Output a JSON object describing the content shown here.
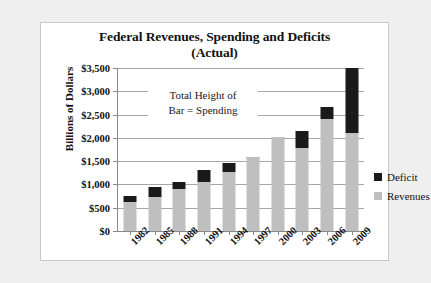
{
  "chart_data": {
    "type": "bar",
    "title": "Federal Revenues, Spending  and Deficits (Actual)",
    "title_line1": "Federal Revenues, Spending  and Deficits",
    "title_line2": "(Actual)",
    "xlabel": "",
    "ylabel": "Billions of Dollars",
    "ylim": [
      0,
      3500
    ],
    "ytick_labels": [
      "$3,500",
      "$3,000",
      "$2,500",
      "$2,000",
      "$1,500",
      "$1,000",
      "$500",
      "$0"
    ],
    "ytick_values": [
      3500,
      3000,
      2500,
      2000,
      1500,
      1000,
      500,
      0
    ],
    "grid": true,
    "stacked": true,
    "legend_position": "right",
    "annotation": "Total Height of Bar = Spending",
    "annotation_line1": "Total Height of",
    "annotation_line2": "Bar = Spending",
    "categories": [
      "1982",
      "1985",
      "1988",
      "1991",
      "1994",
      "1997",
      "2000",
      "2003",
      "2006",
      "2009"
    ],
    "series": [
      {
        "name": "Revenues",
        "color": "#bfbfbf",
        "values": [
          620,
          740,
          910,
          1050,
          1260,
          1580,
          2025,
          1780,
          2410,
          2100
        ]
      },
      {
        "name": "Deficit",
        "color": "#1a1a1a",
        "values": [
          130,
          210,
          150,
          270,
          200,
          20,
          0,
          375,
          250,
          1400
        ]
      }
    ],
    "spending_totals": [
      750,
      950,
      1060,
      1320,
      1460,
      1600,
      2025,
      2155,
      2660,
      3500
    ]
  },
  "legend": {
    "items": [
      {
        "label": "Deficit",
        "color": "#1a1a1a"
      },
      {
        "label": "Revenues",
        "color": "#bfbfbf"
      }
    ]
  }
}
